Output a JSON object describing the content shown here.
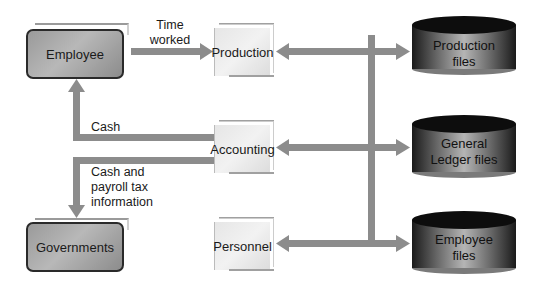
{
  "diagram": {
    "type": "data-flow",
    "entities": [
      {
        "id": "employee",
        "label": "Employee",
        "kind": "external"
      },
      {
        "id": "governments",
        "label": "Governments",
        "kind": "external"
      }
    ],
    "processes": [
      {
        "id": "production",
        "label": "Production"
      },
      {
        "id": "accounting",
        "label": "Accounting"
      },
      {
        "id": "personnel",
        "label": "Personnel"
      }
    ],
    "stores": [
      {
        "id": "production_files",
        "line1": "Production",
        "line2": "files"
      },
      {
        "id": "gl_files",
        "line1": "General",
        "line2": "Ledger files"
      },
      {
        "id": "employee_files",
        "line1": "Employee",
        "line2": "files"
      }
    ],
    "flows": [
      {
        "from": "employee",
        "to": "production",
        "label_line1": "Time",
        "label_line2": "worked"
      },
      {
        "from": "accounting",
        "to": "employee",
        "label": "Cash"
      },
      {
        "from": "accounting",
        "to": "governments",
        "label_line1": "Cash and",
        "label_line2": "payroll tax",
        "label_line3": "information"
      },
      {
        "between": [
          "production",
          "production_files"
        ],
        "bidirectional": true
      },
      {
        "between": [
          "accounting",
          "gl_files"
        ],
        "bidirectional": true
      },
      {
        "between": [
          "personnel",
          "employee_files"
        ],
        "bidirectional": true
      }
    ]
  },
  "colors": {
    "arrow": "#8c8c8c",
    "external_fill": "#a6a6a6",
    "process_fill": "#ececec",
    "store_dark": "#111111"
  }
}
